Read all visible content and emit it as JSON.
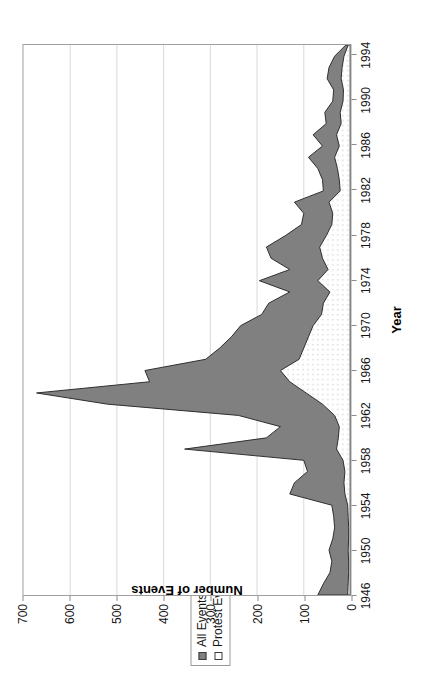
{
  "figure": {
    "legend": {
      "position": "top-left-outside",
      "entries": [
        {
          "label": "All Events",
          "marker": "filled-square",
          "color": "#808080"
        },
        {
          "label": "Protest Events",
          "marker": "hollow-square",
          "color": "#ffffff"
        }
      ]
    }
  },
  "chart_data": {
    "type": "area",
    "title": "",
    "subtitle": "",
    "xlabel": "Year",
    "ylabel": "Number of Events",
    "orientation": "rotated-90-ccw",
    "grid": {
      "x_gridlines": true,
      "y_gridlines": false
    },
    "xlim": [
      1946,
      1995
    ],
    "ylim": [
      0,
      700
    ],
    "xticks": [
      1946,
      1950,
      1954,
      1958,
      1962,
      1966,
      1970,
      1974,
      1978,
      1982,
      1986,
      1990,
      1994
    ],
    "xtick_labels": [
      "1946",
      "1950",
      "1954",
      "1958",
      "1962",
      "1966",
      "1970",
      "1974",
      "1978",
      "1982",
      "1986",
      "1990",
      "1994"
    ],
    "yticks": [
      0,
      100,
      200,
      300,
      400,
      500,
      600,
      700
    ],
    "ytick_labels": [
      "0",
      "100",
      "200",
      "300",
      "400",
      "500",
      "600",
      "700"
    ],
    "x": [
      1946,
      1947,
      1948,
      1949,
      1950,
      1951,
      1952,
      1953,
      1954,
      1955,
      1956,
      1957,
      1958,
      1959,
      1960,
      1961,
      1962,
      1963,
      1964,
      1965,
      1966,
      1967,
      1968,
      1969,
      1970,
      1971,
      1972,
      1973,
      1974,
      1975,
      1976,
      1977,
      1978,
      1979,
      1980,
      1981,
      1982,
      1983,
      1984,
      1985,
      1986,
      1987,
      1988,
      1989,
      1990,
      1991,
      1992,
      1993,
      1994,
      1995
    ],
    "series": [
      {
        "name": "All Events",
        "marker": "filled-square",
        "color": "#808080",
        "values": [
          70,
          58,
          44,
          40,
          46,
          38,
          34,
          36,
          40,
          130,
          120,
          92,
          100,
          355,
          180,
          150,
          240,
          520,
          672,
          430,
          440,
          310,
          280,
          255,
          235,
          190,
          175,
          130,
          195,
          130,
          170,
          180,
          140,
          105,
          100,
          120,
          58,
          60,
          70,
          90,
          60,
          80,
          52,
          55,
          38,
          36,
          50,
          46,
          34,
          10
        ]
      },
      {
        "name": "Protest Events",
        "marker": "hollow-square",
        "color": "#ffffff",
        "values": [
          6,
          5,
          4,
          4,
          5,
          4,
          4,
          5,
          6,
          12,
          14,
          12,
          16,
          30,
          26,
          24,
          34,
          60,
          95,
          130,
          150,
          110,
          100,
          90,
          80,
          62,
          58,
          44,
          70,
          48,
          60,
          66,
          52,
          40,
          38,
          46,
          22,
          24,
          28,
          34,
          24,
          30,
          20,
          22,
          16,
          15,
          20,
          18,
          14,
          5
        ]
      }
    ],
    "annotations": []
  }
}
